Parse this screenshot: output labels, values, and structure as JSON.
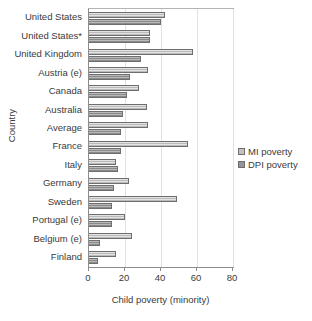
{
  "chart_data": {
    "type": "bar",
    "orientation": "horizontal",
    "title": "",
    "xlabel": "Child poverty (minority)",
    "ylabel": "Country",
    "xlim": [
      0,
      80
    ],
    "xticks": [
      0,
      20,
      40,
      60,
      80
    ],
    "grid": true,
    "grid_axis": "x",
    "legend_position": "right",
    "categories": [
      "United States",
      "United States*",
      "United Kingdom",
      "Austria (e)",
      "Canada",
      "Australia",
      "Average",
      "France",
      "Italy",
      "Germany",
      "Sweden",
      "Portugal (e)",
      "Belgium (e)",
      "Finland"
    ],
    "series": [
      {
        "name": "MI poverty",
        "color": "#c2c2c2",
        "values": [
          42,
          34,
          58,
          33,
          28,
          32,
          33,
          55,
          15,
          22,
          49,
          20,
          24,
          15
        ]
      },
      {
        "name": "DPI poverty",
        "color": "#949494",
        "values": [
          40,
          34,
          29,
          23,
          21,
          19,
          18,
          18,
          16,
          14,
          13,
          13,
          6,
          5
        ]
      }
    ]
  },
  "legend": {
    "items": [
      {
        "label": "MI poverty",
        "key": "mi"
      },
      {
        "label": "DPI poverty",
        "key": "dpi"
      }
    ]
  }
}
